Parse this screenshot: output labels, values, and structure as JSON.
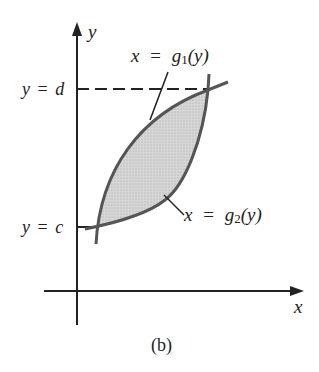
{
  "figure": {
    "caption": "(b)",
    "axes": {
      "x_label": "x",
      "y_label": "y"
    },
    "curves": [
      {
        "name": "g1",
        "label_lhs": "x",
        "label_eq": "=",
        "label_fn": "g",
        "label_sub": "1",
        "label_arg": "(y)"
      },
      {
        "name": "g2",
        "label_lhs": "x",
        "label_eq": "=",
        "label_fn": "g",
        "label_sub": "2",
        "label_arg": "(y)"
      }
    ],
    "bounds": {
      "upper": {
        "lhs": "y",
        "eq": "=",
        "rhs": "d"
      },
      "lower": {
        "lhs": "y",
        "eq": "=",
        "rhs": "c"
      }
    },
    "colors": {
      "curve": "#555555",
      "fill": "#cfcfcf",
      "axis": "#222222"
    }
  }
}
